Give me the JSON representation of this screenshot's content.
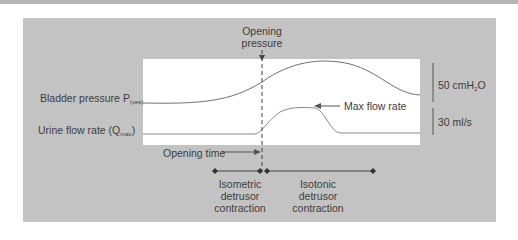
{
  "diagram": {
    "title_annotation": {
      "line1": "Opening",
      "line2": "pressure"
    },
    "labels": {
      "bladder_pressure": "Bladder pressure P",
      "bladder_pressure_sub": "(ves)",
      "urine_flow": "Urine flow rate (Q",
      "urine_flow_sub": "max",
      "urine_flow_close": ")",
      "max_flow": "Max flow rate",
      "opening_time": "Opening time"
    },
    "scale_bars": [
      {
        "value": "50 cmH",
        "sub": "2",
        "suffix": "O"
      },
      {
        "value": "30 ml/s"
      }
    ],
    "phases": [
      {
        "line1": "Isometric",
        "line2": "detrusor",
        "line3": "contraction"
      },
      {
        "line1": "Isotonic",
        "line2": "detrusor",
        "line3": "contraction"
      }
    ]
  },
  "colors": {
    "panel": "#c3c3c3",
    "curve": "#6e6e6e",
    "text": "#3d3d3d"
  }
}
